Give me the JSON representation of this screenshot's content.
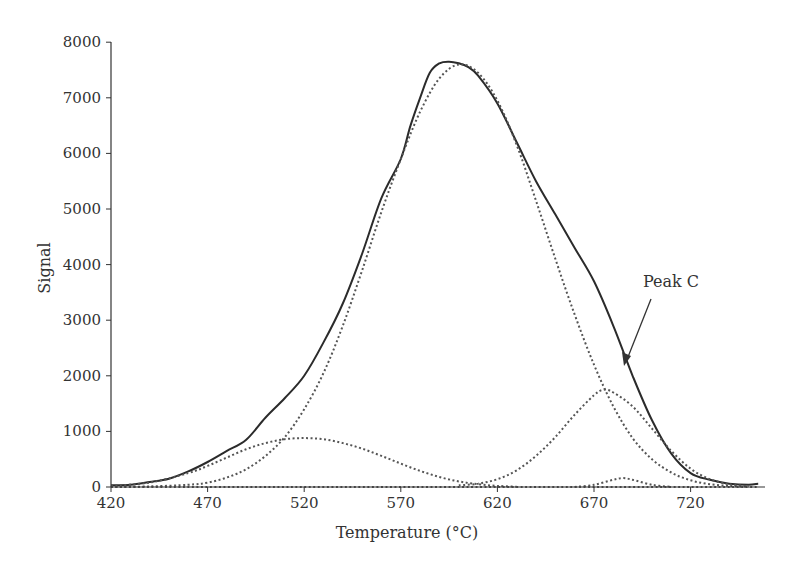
{
  "chart_data": {
    "type": "line",
    "title": "",
    "xlabel": "Temperature (°C)",
    "ylabel": "Signal",
    "xlim": [
      420,
      755
    ],
    "ylim": [
      0,
      8000
    ],
    "x_ticks": [
      420,
      470,
      520,
      570,
      620,
      670,
      720
    ],
    "y_ticks": [
      0,
      1000,
      2000,
      3000,
      4000,
      5000,
      6000,
      7000,
      8000
    ],
    "grid": false,
    "legend": "none",
    "annotations": [
      {
        "text": "Peak C",
        "text_pos": [
          643,
          282
        ],
        "arrow_from": [
          651,
          295
        ],
        "arrow_to": [
          624,
          364
        ]
      }
    ],
    "series": [
      {
        "name": "Measured signal",
        "style": "solid",
        "color": "#2b2b2b",
        "x": [
          420,
          430,
          440,
          450,
          460,
          470,
          480,
          490,
          500,
          510,
          520,
          530,
          540,
          550,
          560,
          570,
          575,
          580,
          585,
          590,
          595,
          600,
          605,
          610,
          620,
          630,
          640,
          650,
          660,
          670,
          680,
          690,
          700,
          710,
          720,
          730,
          740,
          750,
          755
        ],
        "y": [
          30,
          40,
          90,
          150,
          280,
          450,
          650,
          850,
          1250,
          1600,
          2000,
          2600,
          3300,
          4200,
          5200,
          5900,
          6500,
          7000,
          7450,
          7620,
          7650,
          7620,
          7550,
          7400,
          6900,
          6200,
          5500,
          4900,
          4300,
          3700,
          2900,
          2000,
          1200,
          600,
          250,
          130,
          60,
          40,
          60
        ]
      },
      {
        "name": "Main peak (fit)",
        "style": "dotted",
        "color": "#555555",
        "x": [
          420,
          440,
          460,
          470,
          480,
          490,
          500,
          510,
          520,
          530,
          540,
          550,
          560,
          570,
          580,
          590,
          600,
          610,
          620,
          630,
          640,
          650,
          660,
          670,
          680,
          690,
          700,
          710,
          720,
          730,
          740,
          750
        ],
        "y": [
          0,
          10,
          40,
          80,
          170,
          320,
          560,
          900,
          1400,
          2050,
          2900,
          3900,
          4950,
          5900,
          6750,
          7350,
          7600,
          7450,
          6950,
          6150,
          5150,
          4100,
          3100,
          2200,
          1450,
          880,
          500,
          260,
          120,
          50,
          20,
          5
        ]
      },
      {
        "name": "Low-temperature peak (fit)",
        "style": "dotted",
        "color": "#555555",
        "x": [
          420,
          440,
          460,
          470,
          480,
          490,
          500,
          510,
          520,
          530,
          540,
          550,
          560,
          570,
          580,
          590,
          600,
          610,
          620,
          630
        ],
        "y": [
          20,
          80,
          250,
          380,
          530,
          680,
          790,
          860,
          880,
          860,
          790,
          690,
          560,
          420,
          290,
          180,
          100,
          50,
          20,
          5
        ]
      },
      {
        "name": "Peak C (fit)",
        "style": "dotted",
        "color": "#555555",
        "x": [
          600,
          610,
          620,
          630,
          640,
          650,
          660,
          670,
          675,
          680,
          690,
          700,
          710,
          720,
          730,
          740,
          750
        ],
        "y": [
          30,
          60,
          140,
          300,
          560,
          900,
          1300,
          1650,
          1750,
          1700,
          1450,
          1050,
          650,
          330,
          140,
          50,
          15
        ]
      },
      {
        "name": "Minor peak (fit)",
        "style": "dotted",
        "color": "#555555",
        "x": [
          660,
          670,
          680,
          685,
          690,
          700,
          710
        ],
        "y": [
          0,
          40,
          130,
          160,
          130,
          40,
          0
        ]
      },
      {
        "name": "Baseline",
        "style": "dotted",
        "color": "#555555",
        "x": [
          420,
          755
        ],
        "y": [
          0,
          0
        ]
      }
    ]
  }
}
